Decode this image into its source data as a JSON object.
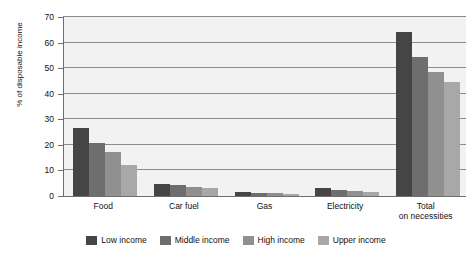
{
  "chart_data": {
    "type": "bar",
    "xlabel": "",
    "ylabel": "% of disposable income",
    "ylim": [
      0,
      70
    ],
    "yticks": [
      0,
      10,
      20,
      30,
      40,
      50,
      60,
      70
    ],
    "grid": true,
    "legend_position": "bottom",
    "categories": [
      "Food",
      "Car fuel",
      "Gas",
      "Electricity",
      "Total\non necessities"
    ],
    "category_labels": [
      {
        "line1": "Food",
        "line2": ""
      },
      {
        "line1": "Car fuel",
        "line2": ""
      },
      {
        "line1": "Gas",
        "line2": ""
      },
      {
        "line1": "Electricity",
        "line2": ""
      },
      {
        "line1": "Total",
        "line2": "on necessities"
      }
    ],
    "series": [
      {
        "name": "Low income",
        "color": "#454545",
        "values": [
          26.5,
          4.6,
          1.5,
          3.2,
          64.0
        ]
      },
      {
        "name": "Middle income",
        "color": "#6e6e6e",
        "values": [
          20.8,
          4.3,
          1.2,
          2.3,
          54.5
        ]
      },
      {
        "name": "High income",
        "color": "#909090",
        "values": [
          17.2,
          3.7,
          1.0,
          2.0,
          48.5
        ]
      },
      {
        "name": "Upper income",
        "color": "#a8a8a8",
        "values": [
          12.3,
          3.0,
          0.7,
          1.6,
          44.5
        ]
      }
    ]
  },
  "colors": {
    "plot_background": "#f2f2f2",
    "gridline": "#8c8c8c",
    "axis": "#6e6e6e",
    "text": "#111111"
  }
}
